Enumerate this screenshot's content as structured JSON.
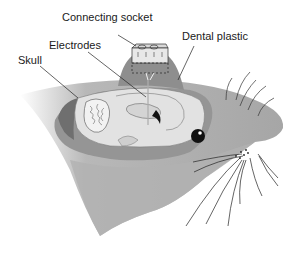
{
  "figure": {
    "type": "anatomical-diagram",
    "labels": {
      "connecting_socket": "Connecting socket",
      "dental_plastic": "Dental plastic",
      "electrodes": "Electrodes",
      "skull": "Skull"
    },
    "colors": {
      "background": "#ffffff",
      "head_fill": "#a8a8a8",
      "head_shadow": "#8c8c8c",
      "skull_fill": "#9a9a9a",
      "brain_fill": "#e4e4e4",
      "plastic_fill": "#8f8f8f",
      "socket_fill": "#e6e6e6",
      "line": "#222222",
      "eye": "#111111"
    }
  }
}
